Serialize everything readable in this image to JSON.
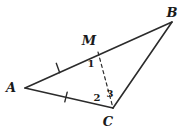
{
  "figure": {
    "background_color": "#ffffff",
    "stroke_color": "#2b2b2b",
    "label_color": "#1a1a1a",
    "width": 191,
    "height": 130,
    "points": {
      "A": {
        "label": "A",
        "x": 25,
        "y": 88,
        "label_x": 11,
        "label_y": 92
      },
      "B": {
        "label": "B",
        "x": 172,
        "y": 22,
        "label_x": 172,
        "label_y": 17
      },
      "C": {
        "label": "C",
        "x": 113,
        "y": 108,
        "label_x": 108,
        "label_y": 126
      },
      "M": {
        "label": "M",
        "x": 98,
        "y": 52,
        "label_x": 89,
        "label_y": 45
      }
    },
    "segments": [
      {
        "name": "segment-AB",
        "from": "A",
        "to": "B",
        "style": "solid",
        "ticks": 0
      },
      {
        "name": "segment-AC",
        "from": "A",
        "to": "C",
        "style": "solid",
        "ticks": 1
      },
      {
        "name": "segment-BC",
        "from": "B",
        "to": "C",
        "style": "solid",
        "ticks": 0
      },
      {
        "name": "segment-MC",
        "from": "M",
        "to": "C",
        "style": "dashed",
        "ticks": 0
      }
    ],
    "tick_marks": [
      {
        "name": "tick-mark-AM",
        "on": "segment-AM",
        "x": 58,
        "y": 68,
        "angle": 70
      },
      {
        "name": "tick-mark-AC",
        "on": "segment-AC",
        "x": 66,
        "y": 97,
        "angle": 104
      }
    ],
    "angle_labels": [
      {
        "name": "angle-label-1",
        "text": "1",
        "x": 91,
        "y": 67,
        "at_vertex": "M"
      },
      {
        "name": "angle-label-2",
        "text": "2",
        "x": 97,
        "y": 101,
        "at_vertex": "C"
      },
      {
        "name": "angle-label-3",
        "text": "3",
        "x": 110,
        "y": 97,
        "at_vertex": "C"
      }
    ]
  }
}
